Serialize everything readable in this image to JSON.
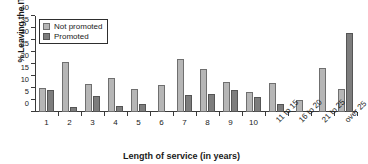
{
  "chart_data": {
    "type": "bar",
    "title": "",
    "xlabel": "Length of service (in years)",
    "ylabel": "% Leaving the IT division",
    "categories": [
      "1",
      "2",
      "3",
      "4",
      "5",
      "6",
      "7",
      "8",
      "9",
      "10",
      "11 to 15",
      "16 to 20",
      "21 to 25",
      "over 25"
    ],
    "series": [
      {
        "name": "Not promoted",
        "color": "#b6b6b6",
        "values": [
          10.0,
          20.7,
          11.5,
          14.3,
          9.6,
          11.3,
          22.1,
          17.9,
          12.7,
          8.5,
          12.0,
          5.1,
          18.4,
          9.4
        ]
      },
      {
        "name": "Promoted",
        "color": "#7d7d7d",
        "values": [
          9.3,
          2.0,
          6.7,
          2.7,
          3.5,
          0,
          7.1,
          7.7,
          9.2,
          6.2,
          3.5,
          0,
          0,
          33.0
        ]
      }
    ],
    "ylim": [
      0,
      40
    ],
    "yticks": [
      0,
      5,
      10,
      15,
      20,
      25,
      30,
      35,
      40
    ],
    "ytick_labels": [
      "0",
      "5",
      "10",
      "15",
      "20",
      "25",
      "30",
      "35",
      "40"
    ],
    "grid": false,
    "legend_position": "top-left",
    "legend": [
      "Not promoted",
      "Promoted"
    ]
  }
}
